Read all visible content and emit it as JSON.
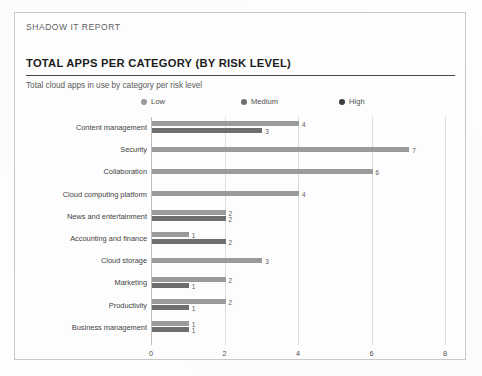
{
  "document": {
    "report_tag": "SHADOW IT REPORT"
  },
  "chart_data": {
    "type": "bar",
    "orientation": "horizontal",
    "title": "TOTAL APPS PER CATEGORY (BY RISK LEVEL)",
    "subtitle": "Total cloud apps in use by category per risk level",
    "xlabel": "",
    "ylabel": "",
    "xlim": [
      0,
      8
    ],
    "xticks": [
      0,
      2,
      4,
      6,
      8
    ],
    "xtick_labels": [
      "0",
      "2",
      "4",
      "6",
      "8"
    ],
    "grid": true,
    "legend_position": "top",
    "categories": [
      "Content management",
      "Security",
      "Collaboration",
      "Cloud computing platform",
      "News and entertainment",
      "Accounting and finance",
      "Cloud storage",
      "Marketing",
      "Productivity",
      "Business management"
    ],
    "series": [
      {
        "name": "Low",
        "color": "#9a9a9a",
        "values": [
          4,
          7,
          6,
          4,
          2,
          1,
          3,
          2,
          2,
          1
        ]
      },
      {
        "name": "Medium",
        "color": "#6e6e6e",
        "values": [
          3,
          null,
          null,
          null,
          2,
          2,
          null,
          1,
          1,
          1
        ]
      },
      {
        "name": "High",
        "color": "#3c3c3c",
        "values": [
          null,
          null,
          null,
          null,
          null,
          null,
          null,
          null,
          null,
          null
        ]
      }
    ],
    "data_labels": [
      [
        "4",
        "3"
      ],
      [
        "7"
      ],
      [
        "6"
      ],
      [
        "4"
      ],
      [
        "2",
        "2"
      ],
      [
        "1",
        "2"
      ],
      [
        "3"
      ],
      [
        "2",
        "1"
      ],
      [
        "2",
        "1"
      ],
      [
        "1",
        "1"
      ]
    ],
    "legend": [
      {
        "label": "Low",
        "color": "#9a9a9a"
      },
      {
        "label": "Medium",
        "color": "#6e6e6e"
      },
      {
        "label": "High",
        "color": "#3c3c3c"
      }
    ]
  }
}
